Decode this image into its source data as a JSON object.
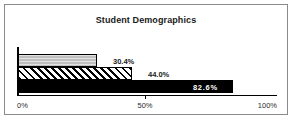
{
  "chart_data": {
    "type": "bar",
    "orientation": "horizontal",
    "title": "Student Demographics",
    "xlabel": "",
    "ylabel": "",
    "categories": [
      "series-1",
      "series-2",
      "series-3"
    ],
    "values": [
      30.4,
      44.0,
      82.6
    ],
    "data_labels": [
      "30.4%",
      "44.0%",
      "82.6%"
    ],
    "xlim": [
      0,
      100
    ],
    "xticks": [
      0,
      50,
      100
    ],
    "xtick_labels": [
      "0%",
      "50%",
      "100%"
    ],
    "grid": false,
    "legend": false,
    "series_styles": [
      {
        "name": "series-1",
        "fill": "#bfbfbf",
        "pattern": "solid-light-gray",
        "edge": "#000000"
      },
      {
        "name": "series-2",
        "fill": "#ffffff",
        "pattern": "diagonal-hatch",
        "edge": "#000000"
      },
      {
        "name": "series-3",
        "fill": "#000000",
        "pattern": "solid-black",
        "edge": "#000000"
      }
    ],
    "label_colors": [
      "#1a1a1a",
      "#1a1a1a",
      "#ffffff"
    ]
  },
  "frame": {
    "border_color": "#8a8a8a",
    "background": "#ffffff"
  },
  "axis": {
    "line_color": "#000000",
    "tick_labels": {
      "start": "0%",
      "middle": "50%",
      "end": "100%"
    }
  }
}
